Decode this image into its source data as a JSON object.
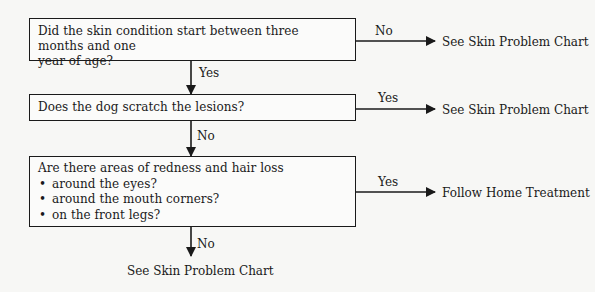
{
  "flowchart": {
    "questions": [
      {
        "id": "q1",
        "text": "Did the skin condition start between three months and one year of age?",
        "lines": [
          "Did the skin condition start between three months and one",
          "year of age?"
        ]
      },
      {
        "id": "q2",
        "text": "Does the dog scratch the lesions?"
      },
      {
        "id": "q3",
        "text": "Are there areas of redness and hair loss",
        "bullets": [
          "around the eyes?",
          "around the mouth corners?",
          "on the front legs?"
        ]
      }
    ],
    "edges": [
      {
        "from": "q1",
        "to": "outcome1",
        "label": "No"
      },
      {
        "from": "q1",
        "to": "q2",
        "label": "Yes"
      },
      {
        "from": "q2",
        "to": "outcome2",
        "label": "Yes"
      },
      {
        "from": "q2",
        "to": "q3",
        "label": "No"
      },
      {
        "from": "q3",
        "to": "outcome3",
        "label": "Yes"
      },
      {
        "from": "q3",
        "to": "outcome4",
        "label": "No"
      }
    ],
    "outcomes": [
      {
        "id": "outcome1",
        "text": "See Skin Problem Chart"
      },
      {
        "id": "outcome2",
        "text": "See Skin Problem Chart"
      },
      {
        "id": "outcome3",
        "text": "Follow Home Treatment"
      },
      {
        "id": "outcome4",
        "text": "See Skin Problem Chart"
      }
    ],
    "bullet_glyph": "•",
    "colors": {
      "background": "#f7f7f5",
      "ink": "#1a1a1a"
    }
  }
}
